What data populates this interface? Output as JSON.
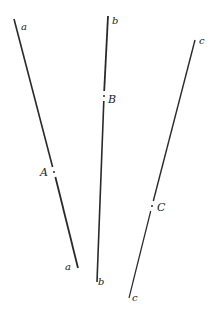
{
  "diagram": {
    "stroke_color": "#2a2a2a",
    "lines": [
      {
        "name": "a",
        "start_label": "a",
        "end_label": "a",
        "point_label": "A",
        "start": [
          14,
          19
        ],
        "end": [
          78,
          268
        ],
        "point": [
          54,
          172
        ]
      },
      {
        "name": "b",
        "start_label": "b",
        "end_label": "b",
        "point_label": "B",
        "start": [
          108,
          16
        ],
        "end": [
          97,
          282
        ],
        "point": [
          104,
          96
        ]
      },
      {
        "name": "c",
        "start_label": "c",
        "end_label": "c",
        "point_label": "C",
        "start": [
          195,
          40
        ],
        "end": [
          129,
          298
        ],
        "point": [
          152,
          206
        ]
      }
    ]
  }
}
